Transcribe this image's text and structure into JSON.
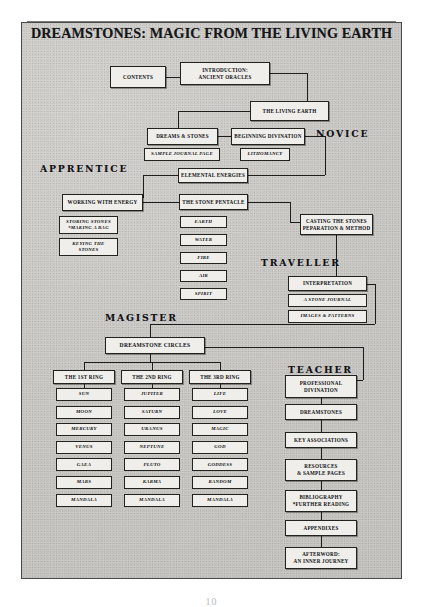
{
  "document": {
    "title": "DREAMSTONES: MAGIC FROM THE LIVING EARTH",
    "page_number": "10"
  },
  "ranks": [
    {
      "id": "novice",
      "label": "NOVICE"
    },
    {
      "id": "apprentice",
      "label": "APPRENTICE"
    },
    {
      "id": "traveller",
      "label": "TRAVELLER"
    },
    {
      "id": "magister",
      "label": "MAGISTER"
    },
    {
      "id": "teacher",
      "label": "TEACHER"
    }
  ],
  "nodes": {
    "contents": "CONTENTS",
    "introduction": "INTRODUCTION:\nANCIENT ORACLES",
    "living_earth": "THE LIVING EARTH",
    "dreams_and_stones": "DREAMS & STONES",
    "beginning_divination": "BEGINNING DIVINATION",
    "sample_journal_page": "SAMPLE JOURNAL PAGE",
    "lithomancy": "LITHOMANCY",
    "elemental_energies": "ELEMENTAL  ENERGIES",
    "working_with_energy": "WORKING WITH ENERGY",
    "the_stone_pentacle": "THE STONE PENTACLE",
    "storing_stones": "STORING STONES\n*MAKING A BAG",
    "keying_the_stones": "KEYING THE\nSTONES",
    "casting_the_stones": "CASTING THE STONES\nPEPARATION & METHOD",
    "interpretation": "INTERPRETATION",
    "a_stone_journal": "A STONE JOURNAL",
    "images_and_patterns": "IMAGES & PATTERNS",
    "dreamstone_circles": "DREAMSTONE CIRCLES",
    "professional_divination": "PROFESSIONAL\nDIVINATION",
    "dreamstones": "DREAMSTONES",
    "key_associations": "KEY  ASSOCIATIONS",
    "resources": "RESOURCES\n& SAMPLE PAGES",
    "bibliography": "BIBLIOGRAPHY\n*FURTHER READING",
    "appendixes": "APPENDIXES",
    "afterword": "AFTERWORD:\nAN INNER JOURNEY"
  },
  "elements": [
    "EARTH",
    "WATER",
    "FIRE",
    "AIR",
    "SPIRIT"
  ],
  "rings": [
    {
      "id": "first-ring",
      "header": "THE 1ST RING",
      "items": [
        "SUN",
        "MOON",
        "MERCURY",
        "VENUS",
        "GAEA",
        "MARS",
        "MANDALA"
      ]
    },
    {
      "id": "second-ring",
      "header": "THE 2ND RING",
      "items": [
        "JUPITER",
        "SATURN",
        "URANUS",
        "NEPTUNE",
        "PLUTO",
        "KARMA",
        "MANDALA"
      ]
    },
    {
      "id": "third-ring",
      "header": "THE 3RD RING",
      "items": [
        "LIFE",
        "LOVE",
        "MAGIC",
        "GOD",
        "GODDESS",
        "RANDOM",
        "MANDALA"
      ]
    }
  ],
  "teacher_column": [
    "PROFESSIONAL\nDIVINATION",
    "DREAMSTONES",
    "KEY  ASSOCIATIONS",
    "RESOURCES\n& SAMPLE PAGES",
    "BIBLIOGRAPHY\n*FURTHER READING",
    "APPENDIXES",
    "AFTERWORD:\nAN INNER JOURNEY"
  ],
  "colors": {
    "paper": "#cfcdc9",
    "box_fill": "#efeeea",
    "ink": "#16161a",
    "border": "#4a4a48"
  }
}
